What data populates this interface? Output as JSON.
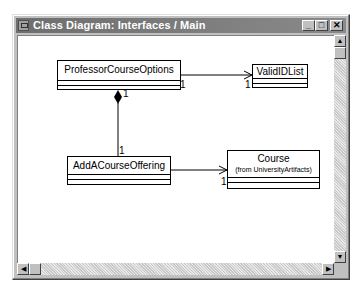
{
  "window": {
    "title": "Class Diagram: Interfaces / Main",
    "controls": {
      "minimize": "_",
      "maximize": "□",
      "close": "✕"
    }
  },
  "diagram": {
    "classes": [
      {
        "id": "professor-course-options",
        "name": "ProfessorCourseOptions"
      },
      {
        "id": "valid-id-list",
        "name": "ValidIDList"
      },
      {
        "id": "add-a-course-offering",
        "name": "AddACourseOffering"
      },
      {
        "id": "course",
        "name": "Course",
        "package_note": "(from UniversityArtifacts)"
      }
    ],
    "relationships": [
      {
        "type": "association",
        "from": "ProfessorCourseOptions",
        "to": "ValidIDList",
        "from_multiplicity": "1",
        "to_multiplicity": "1"
      },
      {
        "type": "composition",
        "from": "ProfessorCourseOptions",
        "to": "AddACourseOffering",
        "from_multiplicity": "1",
        "to_multiplicity": "1"
      },
      {
        "type": "association",
        "from": "AddACourseOffering",
        "to": "Course",
        "to_multiplicity": "1"
      }
    ],
    "multiplicities": {
      "pco_right": "1",
      "valid_left": "1",
      "pco_bottom": "1",
      "add_top": "1",
      "course_left": "1"
    }
  },
  "scrollbars": {
    "up": "▲",
    "down": "▼",
    "left": "◀",
    "right": "▶"
  },
  "colors": {
    "titlebar": "#7a7a7a",
    "frame": "#c0c0c0",
    "canvas": "#ffffff"
  }
}
